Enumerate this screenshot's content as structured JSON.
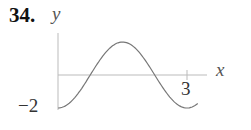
{
  "problem_number": "34.",
  "chart_data": {
    "type": "line",
    "title": "",
    "xlabel": "x",
    "ylabel": "y",
    "x_tick_labels": [
      "3"
    ],
    "y_tick_labels": [
      "-2"
    ],
    "series": [
      {
        "name": "curve",
        "function": "y = -2cos(2πx/3)",
        "x": [
          0,
          0.25,
          0.5,
          0.75,
          1.0,
          1.25,
          1.5,
          1.75,
          2.0,
          2.25,
          2.5,
          2.75,
          3.0,
          3.25
        ],
        "y": [
          -2,
          -1.73,
          -1,
          0,
          1,
          1.73,
          2,
          1.73,
          1,
          0,
          -1,
          -1.73,
          -2,
          -1.73
        ]
      }
    ],
    "xlim": [
      0,
      3.5
    ],
    "ylim": [
      -2,
      2.5
    ],
    "grid": false,
    "legend": "none",
    "colors": {
      "curve": "#777777",
      "axes": "#bbbbbb"
    }
  },
  "labels": {
    "y_axis": "y",
    "x_axis": "x",
    "tick_x": "3",
    "tick_y": "−2"
  }
}
